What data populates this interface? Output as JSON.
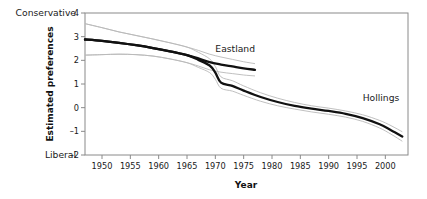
{
  "chart_data": {
    "type": "line",
    "title": "",
    "xlabel": "Year",
    "ylabel": "Estimated preferences",
    "xlim": [
      1947,
      2004
    ],
    "ylim": [
      -2,
      4
    ],
    "grid": false,
    "legend_position": "inline-end-labels",
    "y_anchor_high": "Conservative",
    "y_anchor_low": "Liberal",
    "xticks": [
      1950,
      1955,
      1960,
      1965,
      1970,
      1975,
      1980,
      1985,
      1990,
      1995,
      2000
    ],
    "xticklabels": [
      "1950",
      "1955",
      "1960",
      "1965",
      "1970",
      "1975",
      "1980",
      "1985",
      "1990",
      "1995",
      "2000"
    ],
    "yticks": [
      -2,
      -1,
      0,
      1,
      2,
      3,
      4
    ],
    "yticklabels": [
      "-2",
      "-1",
      "0",
      "1",
      "2",
      "3",
      "4"
    ],
    "series": [
      {
        "name": "Eastland",
        "label": "Eastland",
        "color": "#111111",
        "x": [
          1947,
          1950,
          1953,
          1956,
          1959,
          1962,
          1965,
          1967,
          1969,
          1971,
          1973,
          1975,
          1977
        ],
        "values": [
          2.88,
          2.82,
          2.74,
          2.64,
          2.52,
          2.38,
          2.22,
          2.08,
          1.92,
          1.82,
          1.74,
          1.66,
          1.6
        ],
        "band_upper": [
          3.55,
          3.38,
          3.2,
          3.05,
          2.9,
          2.74,
          2.56,
          2.42,
          2.26,
          2.14,
          2.04,
          1.94,
          1.86
        ],
        "band_lower": [
          2.22,
          2.24,
          2.26,
          2.24,
          2.18,
          2.06,
          1.9,
          1.76,
          1.6,
          1.5,
          1.44,
          1.38,
          1.34
        ]
      },
      {
        "name": "Hollings",
        "label": "Hollings",
        "color": "#111111",
        "x": [
          1947,
          1950,
          1953,
          1956,
          1959,
          1962,
          1965,
          1967,
          1969,
          1970,
          1971,
          1973,
          1975,
          1978,
          1981,
          1984,
          1987,
          1990,
          1993,
          1996,
          1999,
          2001,
          2003
        ],
        "values": [
          2.88,
          2.82,
          2.74,
          2.64,
          2.52,
          2.38,
          2.22,
          2.02,
          1.78,
          1.48,
          1.06,
          0.92,
          0.72,
          0.45,
          0.24,
          0.08,
          -0.04,
          -0.14,
          -0.26,
          -0.44,
          -0.7,
          -0.95,
          -1.22
        ],
        "band_upper": [
          3.55,
          3.38,
          3.2,
          3.05,
          2.9,
          2.74,
          2.56,
          2.34,
          2.06,
          1.74,
          1.3,
          1.14,
          0.92,
          0.63,
          0.4,
          0.22,
          0.08,
          -0.02,
          -0.14,
          -0.3,
          -0.54,
          -0.76,
          -1.02
        ],
        "band_lower": [
          2.22,
          2.24,
          2.26,
          2.24,
          2.18,
          2.06,
          1.9,
          1.7,
          1.48,
          1.2,
          0.82,
          0.7,
          0.52,
          0.27,
          0.08,
          -0.06,
          -0.18,
          -0.28,
          -0.4,
          -0.58,
          -0.86,
          -1.12,
          -1.42
        ]
      }
    ],
    "annotations": [
      {
        "text": "Eastland",
        "x": 1970,
        "y": 2.35
      },
      {
        "text": "Hollings",
        "x": 1996,
        "y": 0.3
      }
    ]
  }
}
